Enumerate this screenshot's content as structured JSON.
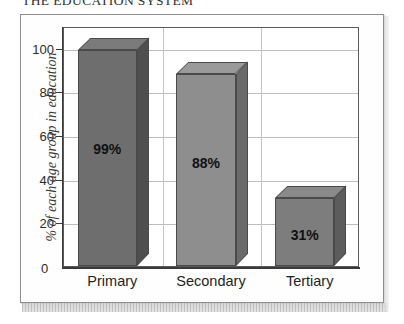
{
  "page": {
    "title": "THE EDUCATION SYSTEM"
  },
  "chart_data": {
    "type": "bar",
    "title": "THE EDUCATION SYSTEM",
    "categories": [
      "Primary",
      "Secondary",
      "Tertiary"
    ],
    "values": [
      99,
      88,
      31
    ],
    "data_labels": [
      "99%",
      "88%",
      "31%"
    ],
    "xlabel": "",
    "ylabel": "% of each age group in education",
    "ylim": [
      0,
      110
    ],
    "yticks": [
      0,
      20,
      40,
      60,
      80,
      100
    ],
    "ytick_labels": [
      "0",
      "20",
      "40",
      "60",
      "80",
      "100"
    ],
    "grid": true,
    "legend": false,
    "style": "3d-bar",
    "colors": {
      "bar_primary_front": "#6e6e6e",
      "bar_primary_top": "#7b7b7b",
      "bar_primary_side": "#4f4f4f",
      "bar_secondary_front": "#8e8e8e",
      "bar_secondary_top": "#9a9a9a",
      "bar_secondary_side": "#6a6a6a",
      "bar_tertiary_front": "#7d7d7d",
      "bar_tertiary_top": "#8a8a8a",
      "bar_tertiary_side": "#5c5c5c",
      "gridline": "#bdbdbd",
      "axis": "#3a3a3a",
      "frame": "#8d8d8d"
    }
  }
}
